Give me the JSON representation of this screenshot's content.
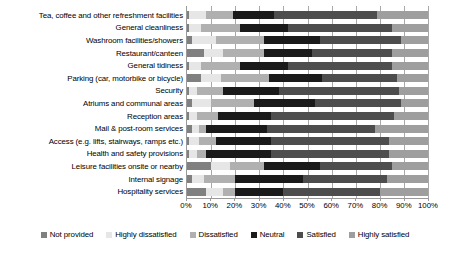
{
  "chart_data": {
    "type": "bar",
    "orientation": "horizontal",
    "stacked": true,
    "normalized": true,
    "title": "",
    "subtitle": "",
    "xlabel": "",
    "ylabel": "",
    "xlim": [
      0,
      100
    ],
    "grid": true,
    "legend_position": "bottom",
    "tick_labels": [
      "0%",
      "10%",
      "20%",
      "30%",
      "40%",
      "50%",
      "60%",
      "70%",
      "80%",
      "90%",
      "100%"
    ],
    "tick_values": [
      0,
      10,
      20,
      30,
      40,
      50,
      60,
      70,
      80,
      90,
      100
    ],
    "categories": [
      "Tea, coffee and other refreshment facilities",
      "General cleanliness",
      "Washroom facilities/showers",
      "Restaurant/canteen",
      "General tidiness",
      "Parking (car, motorbike or bicycle)",
      "Security",
      "Atriums and communal areas",
      "Reception areas",
      "Mail & post-room services",
      "Access (e.g. lifts, stairways, ramps etc.)",
      "Health and safety provisions",
      "Leisure facilities onsite or nearby",
      "Internal signage",
      "Hospitality services"
    ],
    "series": [
      {
        "name": "Not provided",
        "color": "#808080",
        "values": [
          1,
          1,
          2,
          7,
          1,
          6,
          1,
          2,
          1,
          2,
          1,
          1,
          10,
          2,
          8
        ]
      },
      {
        "name": "Highly dissatisfied",
        "color": "#e6e6e6",
        "values": [
          7,
          5,
          10,
          8,
          5,
          8,
          3,
          8,
          3,
          3,
          4,
          3,
          8,
          5,
          7
        ]
      },
      {
        "name": "Dissatisfied",
        "color": "#b0b0b0",
        "values": [
          11,
          16,
          20,
          17,
          16,
          20,
          11,
          18,
          9,
          3,
          7,
          4,
          14,
          13,
          5
        ]
      },
      {
        "name": "Neutral",
        "color": "#1a1a1a",
        "values": [
          17,
          20,
          23,
          20,
          20,
          22,
          23,
          25,
          22,
          25,
          23,
          27,
          23,
          28,
          20
        ]
      },
      {
        "name": "Satisfied",
        "color": "#4d4d4d",
        "values": [
          43,
          43,
          34,
          33,
          43,
          31,
          50,
          36,
          51,
          45,
          49,
          49,
          30,
          35,
          40
        ]
      },
      {
        "name": "Highly satisfied",
        "color": "#9e9e9e",
        "values": [
          21,
          15,
          11,
          15,
          15,
          13,
          12,
          11,
          14,
          22,
          16,
          16,
          15,
          17,
          20
        ]
      }
    ]
  }
}
